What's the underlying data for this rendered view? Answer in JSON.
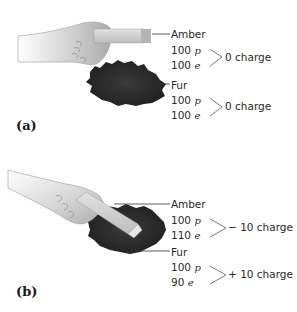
{
  "figure": {
    "panels": [
      {
        "id": "a",
        "label": "(a)",
        "description": "Amber held near fur, before rubbing",
        "objects": [
          {
            "name": "Amber",
            "protons": "100",
            "p_symbol": "p",
            "electrons": "100",
            "e_symbol": "e",
            "charge": "0 charge"
          },
          {
            "name": "Fur",
            "protons": "100",
            "p_symbol": "p",
            "electrons": "100",
            "e_symbol": "e",
            "charge": "0 charge"
          }
        ]
      },
      {
        "id": "b",
        "label": "(b)",
        "description": "Amber rubbed on fur, electrons transferred",
        "objects": [
          {
            "name": "Amber",
            "protons": "100",
            "p_symbol": "p",
            "electrons": "110",
            "e_symbol": "e",
            "charge": "− 10 charge"
          },
          {
            "name": "Fur",
            "protons": "100",
            "p_symbol": "p",
            "electrons": "90",
            "e_symbol": "e",
            "charge": "+ 10 charge"
          }
        ]
      }
    ],
    "colors": {
      "fur": "#2b2b2b",
      "amber_rod": "#c9c9c9",
      "hand_shade": "#b8b8b8",
      "text": "#2a2a2a",
      "leader_line": "#333333"
    }
  }
}
